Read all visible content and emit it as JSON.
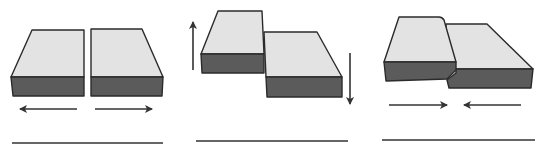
{
  "diagram": {
    "title": "",
    "colors": {
      "top_face": "#e3e3e3",
      "front_face": "#5b5b5b",
      "outline": "#2b2b2b",
      "arrow": "#333333",
      "background": "#ffffff"
    },
    "panels": [
      {
        "id": "divergent",
        "description": "Two blocks separated by a gap, arrows pointing apart",
        "arrows": [
          "left",
          "right"
        ],
        "label": ""
      },
      {
        "id": "vertical-offset",
        "description": "Left block raised, right block lowered; arrow up on left, arrow down on right",
        "arrows": [
          "up",
          "down"
        ],
        "label": ""
      },
      {
        "id": "convergent",
        "description": "Blocks pushed together with overlapping edge, arrows pointing toward each other",
        "arrows": [
          "right",
          "left"
        ],
        "label": ""
      }
    ]
  }
}
